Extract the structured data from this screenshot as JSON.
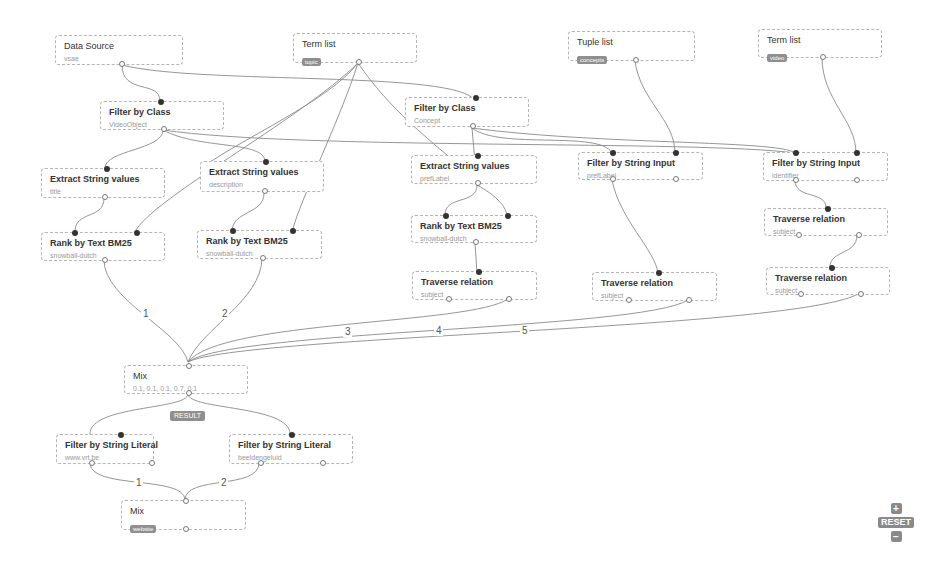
{
  "nodes": {
    "data_source": {
      "title": "Data Source",
      "subtitle": "vsae"
    },
    "term_list_topic": {
      "title": "Term list",
      "badge": "topic"
    },
    "tuple_list": {
      "title": "Tuple list",
      "badge": "concepts"
    },
    "term_list_video": {
      "title": "Term list",
      "badge": "video"
    },
    "filter_class_video": {
      "title": "Filter by Class",
      "subtitle": "VideoObject"
    },
    "filter_class_concept": {
      "title": "Filter by Class",
      "subtitle": "Concept"
    },
    "extract_title": {
      "title": "Extract String values",
      "subtitle": "title"
    },
    "extract_description": {
      "title": "Extract String values",
      "subtitle": "description"
    },
    "extract_preflabel": {
      "title": "Extract String values",
      "subtitle": "prefLabel"
    },
    "filter_input_preflabel": {
      "title": "Filter by String Input",
      "subtitle": "prefLabel"
    },
    "filter_input_identifier": {
      "title": "Filter by String Input",
      "subtitle": "identifier"
    },
    "rank_title": {
      "title": "Rank by Text BM25",
      "subtitle": "snowball-dutch"
    },
    "rank_description": {
      "title": "Rank by Text BM25",
      "subtitle": "snowball-dutch"
    },
    "rank_preflabel": {
      "title": "Rank by Text BM25",
      "subtitle": "snowball-dutch"
    },
    "traverse_1": {
      "title": "Traverse relation",
      "subtitle": "subject"
    },
    "traverse_2": {
      "title": "Traverse relation",
      "subtitle": "subject"
    },
    "traverse_3": {
      "title": "Traverse relation",
      "subtitle": "subject"
    },
    "traverse_4": {
      "title": "Traverse relation",
      "subtitle": "subject"
    },
    "mix_main": {
      "title": "Mix",
      "subtitle": "0.1, 0.1, 0.1, 0.7, 0.1"
    },
    "filter_literal_vrt": {
      "title": "Filter by String Literal",
      "subtitle": "www.vrt.be"
    },
    "filter_literal_beeld": {
      "title": "Filter by String Literal",
      "subtitle": "beeldengeluid"
    },
    "mix_bottom": {
      "title": "Mix",
      "badge": "website"
    }
  },
  "result_badge": "RESULT",
  "edge_labels": {
    "m1": "1",
    "m2": "2",
    "m3": "3",
    "m4": "4",
    "m5": "5",
    "b1": "1",
    "b2": "2"
  },
  "zoom_controls": {
    "zoom_in": "+",
    "reset": "RESET",
    "zoom_out": "−"
  },
  "colors": {
    "edge": "#8a8a8a",
    "badge": "#8f8f8f",
    "input_port": "#333333",
    "node_border": "#b5b5b5"
  }
}
